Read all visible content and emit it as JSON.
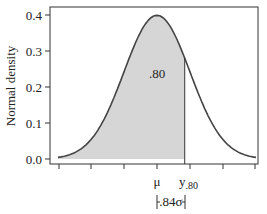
{
  "chart_data": {
    "type": "area",
    "title": "",
    "xlabel": "",
    "ylabel": "Normal density",
    "ylim": [
      0.0,
      0.42
    ],
    "yticks": [
      0.0,
      0.1,
      0.2,
      0.3,
      0.4
    ],
    "ytick_labels": [
      "0.0",
      "0.1",
      "0.2",
      "0.3",
      "0.4"
    ],
    "xlim_sigma": [
      -3,
      3
    ],
    "xticks_sigma": [
      -3,
      -2,
      -1,
      0,
      1,
      2,
      3
    ],
    "xtick_labels": [
      "",
      "",
      "",
      "μ",
      "",
      "",
      ""
    ],
    "grid": false,
    "legend": null,
    "curve": {
      "distribution": "normal",
      "mean_label": "μ",
      "peak_density": 0.399,
      "x_sigma": [
        -3,
        -2.5,
        -2,
        -1.5,
        -1,
        -0.5,
        0,
        0.5,
        0.84,
        1,
        1.5,
        2,
        2.5,
        3
      ],
      "density": [
        0.004,
        0.018,
        0.054,
        0.13,
        0.242,
        0.352,
        0.399,
        0.352,
        0.28,
        0.242,
        0.13,
        0.054,
        0.018,
        0.004
      ]
    },
    "shaded_region": {
      "from_sigma": -3,
      "to_sigma": 0.84,
      "area_label": ".80",
      "fill": "#d6d6d6"
    },
    "annotations": {
      "mu_label": "μ",
      "y80_label_main": "y",
      "y80_label_sub": ".80",
      "distance_label": ".84σ",
      "distance_sigma": 0.84
    }
  },
  "colors": {
    "curve": "#444444",
    "shade": "#d6d6d6",
    "axis": "#333333",
    "background": "#ffffff"
  }
}
